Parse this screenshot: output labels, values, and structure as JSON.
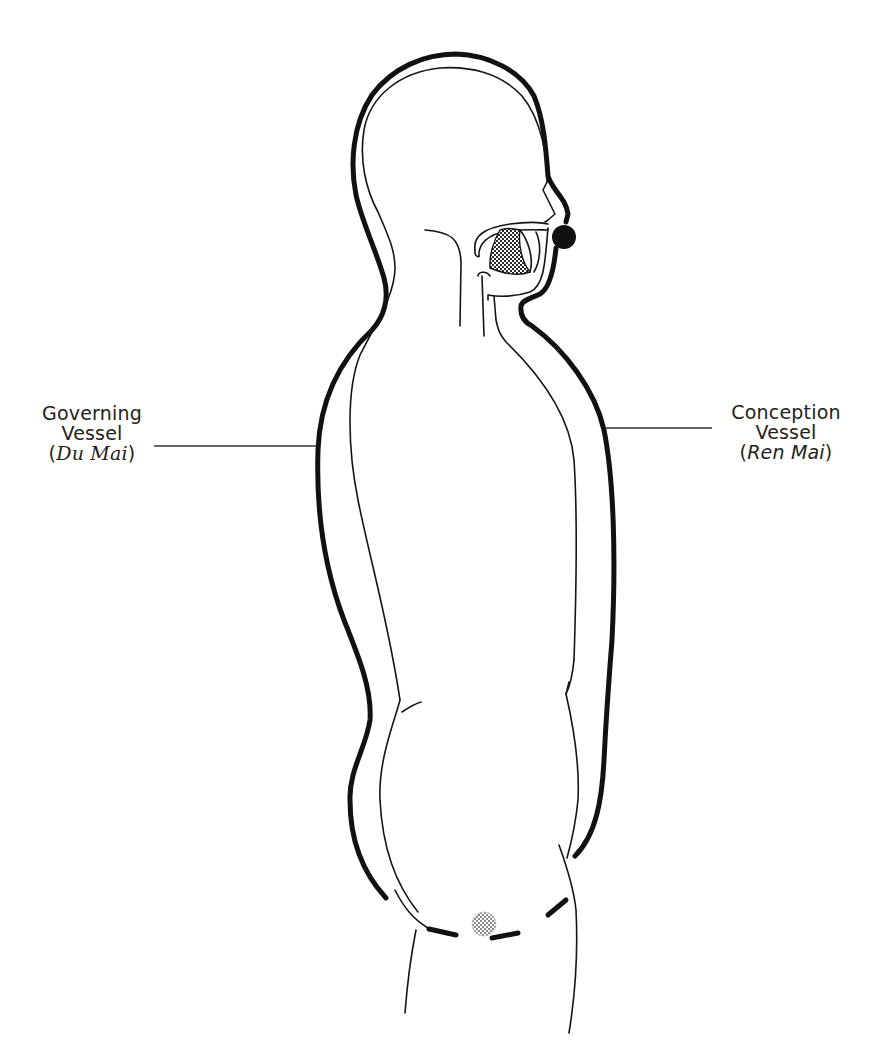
{
  "figure": {
    "colors": {
      "ink": "#111111",
      "background": "#ffffff",
      "hatch_dark": "#3a3a3a",
      "hatch_light": "#9a9a9a"
    }
  },
  "labels": {
    "governing_vessel": {
      "line1": "Governing",
      "line2": "Vessel",
      "paren_open": "(",
      "pinyin": "Du Mai",
      "paren_close": ")"
    },
    "conception_vessel": {
      "line1": "Conception",
      "line2": "Vessel",
      "paren_open": "(",
      "pinyin": "Ren Mai",
      "paren_close": ")"
    }
  },
  "markers": {
    "upper_junction": "solid-black-dot at upper lip / mouth",
    "lower_junction": "hatched-gray-dot at perineum",
    "tongue": "hatched tongue inside mouth cavity"
  }
}
